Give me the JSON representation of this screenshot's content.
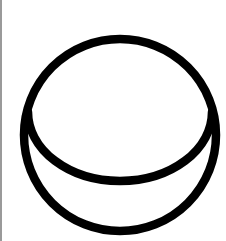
{
  "figure": {
    "icon_name": "circle-with-inner-arc-icon",
    "stroke_color": "#000000",
    "background_color": "#ffffff",
    "border_color": "#9a9a9a"
  }
}
